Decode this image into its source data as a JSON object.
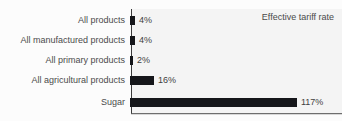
{
  "figure": {
    "title_remnant": "",
    "legend_label": "Effective tariff rate",
    "bar_color": "#15161a",
    "plot_background": "#f4f4f4",
    "axis_color": "#3a3a3a"
  },
  "chart_data": {
    "type": "bar",
    "orientation": "horizontal",
    "title": "",
    "xlabel": "",
    "ylabel": "",
    "legend": [
      "Effective tariff rate"
    ],
    "legend_position": "top-right",
    "grid": false,
    "xlim": [
      0,
      130
    ],
    "categories": [
      "All products",
      "All manufactured products",
      "All primary products",
      "All agricultural products",
      "Sugar"
    ],
    "values": [
      4,
      4,
      2,
      16,
      117
    ],
    "value_labels": [
      "4%",
      "4%",
      "2%",
      "16%",
      "117%"
    ],
    "units": "percent"
  },
  "rows": [
    {
      "label": "All products",
      "value_label": "4%",
      "bar_px": 5,
      "top": 11
    },
    {
      "label": "All manufactured products",
      "value_label": "4%",
      "bar_px": 5,
      "top": 31
    },
    {
      "label": "All primary products",
      "value_label": "2%",
      "bar_px": 3,
      "top": 51
    },
    {
      "label": "All agricultural products",
      "value_label": "16%",
      "bar_px": 24,
      "top": 71
    },
    {
      "label": "Sugar",
      "value_label": "117%",
      "bar_px": 167,
      "top": 93
    }
  ]
}
